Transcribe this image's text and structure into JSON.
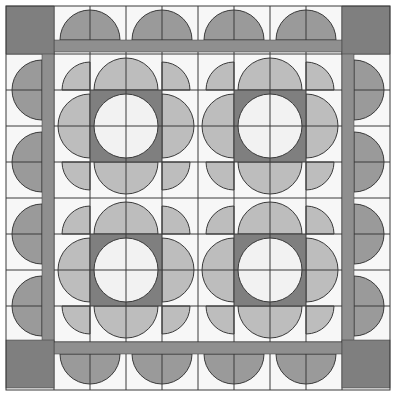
{
  "colors": {
    "background": "#f7f7f7",
    "dark": "#7f7f7f",
    "strip": "#8f8f8f",
    "petal": "#bdbdbd",
    "scallop": "#9a9a9a",
    "center": "#f2f2f2",
    "line": "#3a3a3a"
  },
  "grid": {
    "frame": [
      6,
      390
    ],
    "lines": [
      54,
      90,
      126,
      162,
      198,
      234,
      270,
      306,
      342
    ]
  },
  "blocks": [
    {
      "name": "flower-block-top-left",
      "cx": 126,
      "cy": 126
    },
    {
      "name": "flower-block-top-right",
      "cx": 270,
      "cy": 126
    },
    {
      "name": "flower-block-bottom-left",
      "cx": 126,
      "cy": 270
    },
    {
      "name": "flower-block-bottom-right",
      "cx": 270,
      "cy": 270
    }
  ],
  "border_scallops": {
    "top": [
      90,
      162,
      234,
      306
    ],
    "bottom": [
      90,
      162,
      234,
      306
    ],
    "left": [
      90,
      162,
      234,
      306
    ],
    "right": [
      90,
      162,
      234,
      306
    ]
  }
}
